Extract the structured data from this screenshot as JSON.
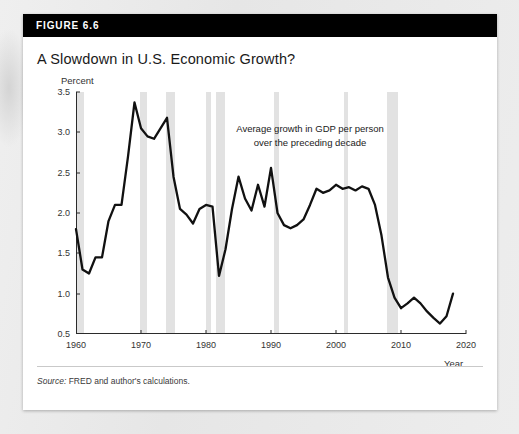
{
  "figure": {
    "label": "FIGURE 6.6",
    "title": "A Slowdown in U.S. Economic Growth?",
    "source_prefix": "Source:",
    "source_text": " FRED and author's calculations."
  },
  "colors": {
    "header_bar": "#000000",
    "card": "#ffffff",
    "page": "#e9e9e9",
    "line": "#111111",
    "recession_band": "#e2e2e2",
    "axis": "#2b2b2b"
  },
  "chart_data": {
    "type": "line",
    "title": "A Slowdown in U.S. Economic Growth?",
    "subtitle": "",
    "xlabel": "Year",
    "ylabel": "Percent",
    "ylim": [
      0.5,
      3.5
    ],
    "xlim": [
      1960,
      2020
    ],
    "yticks": [
      0.5,
      1.0,
      1.5,
      2.0,
      2.5,
      3.0,
      3.5
    ],
    "ytick_labels": [
      "0.5",
      "1.0",
      "1.5",
      "2.0",
      "2.5",
      "3.0",
      "3.5"
    ],
    "xticks": [
      1960,
      1970,
      1980,
      1990,
      2000,
      2010,
      2020
    ],
    "xtick_labels": [
      "1960",
      "1970",
      "1980",
      "1990",
      "2000",
      "2010",
      "2020"
    ],
    "grid": false,
    "legend": "none",
    "annotations": [
      {
        "text": "Average growth in GDP per person\nover the preceding decade",
        "x": 1996,
        "y": 2.95
      }
    ],
    "shaded_regions": {
      "name": "recessions",
      "color": "#e2e2e2",
      "spans": [
        [
          1960.0,
          1961.2
        ],
        [
          1969.8,
          1970.9
        ],
        [
          1973.9,
          1975.2
        ],
        [
          1980.0,
          1980.7
        ],
        [
          1981.5,
          1982.9
        ],
        [
          1990.5,
          1991.3
        ],
        [
          2001.2,
          2001.9
        ],
        [
          2007.9,
          2009.5
        ]
      ]
    },
    "series": [
      {
        "name": "Average growth in GDP per person over the preceding decade",
        "x": [
          1960,
          1961,
          1962,
          1963,
          1964,
          1965,
          1966,
          1967,
          1968,
          1969,
          1970,
          1971,
          1972,
          1973,
          1974,
          1975,
          1976,
          1977,
          1978,
          1979,
          1980,
          1981,
          1982,
          1983,
          1984,
          1985,
          1986,
          1987,
          1988,
          1989,
          1990,
          1991,
          1992,
          1993,
          1994,
          1995,
          1996,
          1997,
          1998,
          1999,
          2000,
          2001,
          2002,
          2003,
          2004,
          2005,
          2006,
          2007,
          2008,
          2009,
          2010,
          2011,
          2012,
          2013,
          2014,
          2015,
          2016,
          2017,
          2018
        ],
        "values": [
          1.8,
          1.3,
          1.25,
          1.45,
          1.45,
          1.9,
          2.1,
          2.1,
          2.7,
          3.37,
          3.05,
          2.95,
          2.92,
          3.05,
          3.18,
          2.45,
          2.05,
          1.98,
          1.87,
          2.05,
          2.1,
          2.08,
          1.22,
          1.55,
          2.05,
          2.45,
          2.18,
          2.03,
          2.35,
          2.08,
          2.56,
          2.0,
          1.85,
          1.81,
          1.85,
          1.92,
          2.1,
          2.3,
          2.25,
          2.28,
          2.35,
          2.3,
          2.32,
          2.28,
          2.33,
          2.3,
          2.1,
          1.72,
          1.2,
          0.95,
          0.82,
          0.88,
          0.95,
          0.88,
          0.78,
          0.7,
          0.63,
          0.72,
          1.0
        ]
      }
    ]
  }
}
